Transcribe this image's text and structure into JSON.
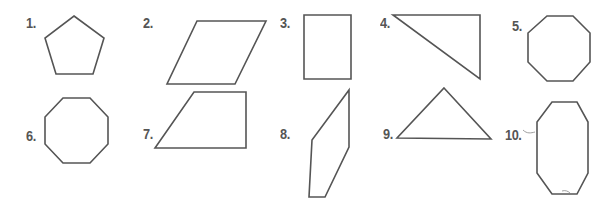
{
  "worksheet": {
    "items": [
      {
        "number": "1.",
        "shape": "pentagon",
        "points": "74,16 104,38 93,74 56,74 45,38",
        "label_x": 26,
        "label_y": 15
      },
      {
        "number": "2.",
        "shape": "parallelogram",
        "points": "197,21 266,21 235,84 167,84",
        "label_x": 143,
        "label_y": 15
      },
      {
        "number": "3.",
        "shape": "rectangle",
        "points": "304,15 351,15 351,79 304,79",
        "label_x": 280,
        "label_y": 15
      },
      {
        "number": "4.",
        "shape": "right-triangle",
        "points": "393,15 480,15 480,79",
        "label_x": 380,
        "label_y": 15
      },
      {
        "number": "5.",
        "shape": "octagon",
        "points": "547,16 573,16 590,33 590,62 573,81 547,81 528,62 528,33",
        "label_x": 512,
        "label_y": 18
      },
      {
        "number": "6.",
        "shape": "octagon",
        "points": "63,98 90,98 108,117 108,144 90,163 63,163 45,144 45,117",
        "label_x": 26,
        "label_y": 128
      },
      {
        "number": "7.",
        "shape": "trapezoid",
        "points": "194,92 246,92 246,148 155,148",
        "label_x": 143,
        "label_y": 126
      },
      {
        "number": "8.",
        "shape": "irregular-quadrilateral",
        "points": "349,90 349,147 325,197 309,197 312,140",
        "label_x": 280,
        "label_y": 126
      },
      {
        "number": "9.",
        "shape": "triangle",
        "points": "444,88 491,139 397,138",
        "label_x": 383,
        "label_y": 126
      },
      {
        "number": "10.",
        "shape": "elongated-octagon",
        "points": "552,102 577,102 588,122 588,173 577,194 552,194 537,173 537,122",
        "label_x": 505,
        "label_y": 127
      }
    ]
  },
  "colors": {
    "ink": "#555555",
    "background": "#ffffff"
  }
}
